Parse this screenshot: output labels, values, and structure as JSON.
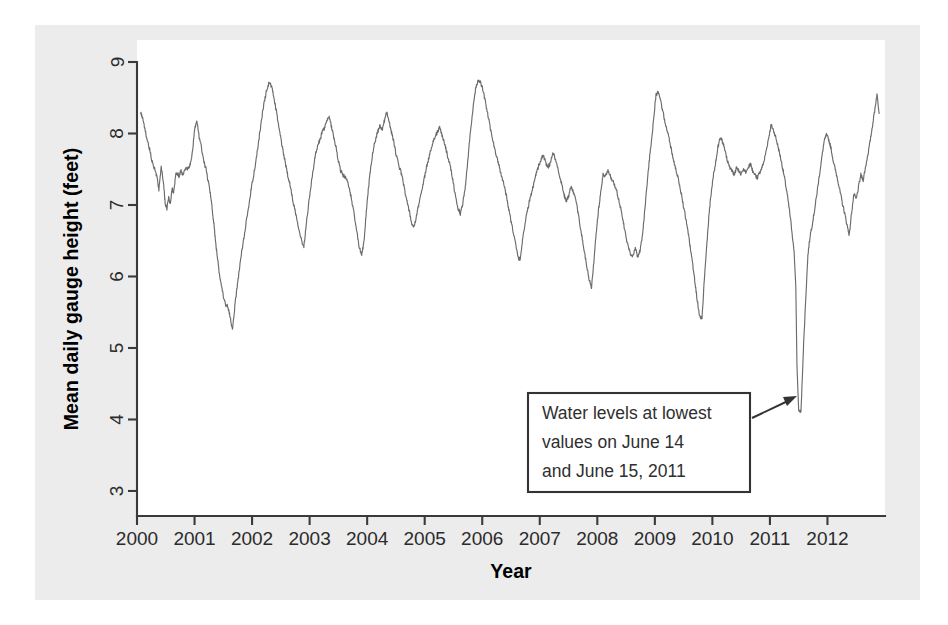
{
  "chart_data": {
    "type": "line",
    "title": "",
    "xlabel": "Year",
    "ylabel": "Mean daily gauge height (feet)",
    "xlim": [
      2000.0,
      2013.0
    ],
    "ylim": [
      2.65,
      9.0
    ],
    "xticks": [
      2000,
      2001,
      2002,
      2003,
      2004,
      2005,
      2006,
      2007,
      2008,
      2009,
      2010,
      2011,
      2012
    ],
    "xtick_labels": [
      "2000",
      "2001",
      "2002",
      "2003",
      "2004",
      "2005",
      "2006",
      "2007",
      "2008",
      "2009",
      "2010",
      "2011",
      "2012"
    ],
    "yticks": [
      3,
      4,
      5,
      6,
      7,
      8,
      9
    ],
    "ytick_labels": [
      "3",
      "4",
      "5",
      "6",
      "7",
      "8",
      "9"
    ],
    "grid": false,
    "legend": false,
    "line_color": "#6b6b6b",
    "series": [
      {
        "name": "Mean daily gauge height",
        "units": "feet",
        "x": [
          2000.06,
          2000.1,
          2000.14,
          2000.18,
          2000.22,
          2000.26,
          2000.3,
          2000.34,
          2000.38,
          2000.42,
          2000.46,
          2000.49,
          2000.52,
          2000.55,
          2000.58,
          2000.61,
          2000.64,
          2000.67,
          2000.7,
          2000.73,
          2000.76,
          2000.8,
          2000.84,
          2000.88,
          2000.92,
          2000.96,
          2001.0,
          2001.04,
          2001.08,
          2001.12,
          2001.16,
          2001.2,
          2001.24,
          2001.28,
          2001.31,
          2001.34,
          2001.37,
          2001.4,
          2001.43,
          2001.46,
          2001.5,
          2001.54,
          2001.58,
          2001.62,
          2001.66,
          2001.7,
          2001.74,
          2001.78,
          2001.82,
          2001.86,
          2001.9,
          2001.94,
          2001.98,
          2002.02,
          2002.06,
          2002.1,
          2002.14,
          2002.18,
          2002.22,
          2002.26,
          2002.3,
          2002.34,
          2002.38,
          2002.42,
          2002.46,
          2002.5,
          2002.54,
          2002.58,
          2002.62,
          2002.66,
          2002.7,
          2002.74,
          2002.78,
          2002.82,
          2002.86,
          2002.9,
          2002.94,
          2002.98,
          2003.02,
          2003.06,
          2003.1,
          2003.14,
          2003.18,
          2003.22,
          2003.26,
          2003.3,
          2003.34,
          2003.38,
          2003.42,
          2003.46,
          2003.5,
          2003.54,
          2003.58,
          2003.62,
          2003.66,
          2003.7,
          2003.74,
          2003.78,
          2003.82,
          2003.86,
          2003.9,
          2003.94,
          2003.98,
          2004.02,
          2004.06,
          2004.1,
          2004.14,
          2004.18,
          2004.22,
          2004.26,
          2004.3,
          2004.34,
          2004.38,
          2004.42,
          2004.46,
          2004.5,
          2004.54,
          2004.58,
          2004.62,
          2004.66,
          2004.7,
          2004.74,
          2004.78,
          2004.82,
          2004.86,
          2004.9,
          2004.94,
          2004.98,
          2005.02,
          2005.06,
          2005.1,
          2005.14,
          2005.18,
          2005.22,
          2005.26,
          2005.3,
          2005.34,
          2005.38,
          2005.42,
          2005.46,
          2005.5,
          2005.54,
          2005.58,
          2005.62,
          2005.66,
          2005.7,
          2005.74,
          2005.78,
          2005.82,
          2005.86,
          2005.9,
          2005.94,
          2005.98,
          2006.02,
          2006.06,
          2006.1,
          2006.14,
          2006.18,
          2006.22,
          2006.26,
          2006.3,
          2006.34,
          2006.38,
          2006.42,
          2006.46,
          2006.5,
          2006.54,
          2006.58,
          2006.62,
          2006.66,
          2006.7,
          2006.74,
          2006.78,
          2006.82,
          2006.86,
          2006.9,
          2006.94,
          2006.98,
          2007.02,
          2007.06,
          2007.1,
          2007.14,
          2007.18,
          2007.22,
          2007.26,
          2007.3,
          2007.34,
          2007.38,
          2007.42,
          2007.46,
          2007.5,
          2007.54,
          2007.58,
          2007.62,
          2007.66,
          2007.7,
          2007.74,
          2007.78,
          2007.82,
          2007.86,
          2007.9,
          2007.94,
          2007.98,
          2008.02,
          2008.06,
          2008.1,
          2008.14,
          2008.18,
          2008.22,
          2008.26,
          2008.3,
          2008.34,
          2008.38,
          2008.42,
          2008.46,
          2008.5,
          2008.54,
          2008.58,
          2008.62,
          2008.66,
          2008.7,
          2008.74,
          2008.78,
          2008.82,
          2008.86,
          2008.9,
          2008.94,
          2008.98,
          2009.02,
          2009.06,
          2009.1,
          2009.14,
          2009.18,
          2009.22,
          2009.26,
          2009.3,
          2009.34,
          2009.38,
          2009.42,
          2009.46,
          2009.5,
          2009.54,
          2009.58,
          2009.62,
          2009.66,
          2009.7,
          2009.74,
          2009.78,
          2009.82,
          2009.86,
          2009.9,
          2009.94,
          2009.98,
          2010.02,
          2010.06,
          2010.1,
          2010.14,
          2010.18,
          2010.22,
          2010.26,
          2010.3,
          2010.34,
          2010.38,
          2010.42,
          2010.46,
          2010.5,
          2010.54,
          2010.58,
          2010.62,
          2010.66,
          2010.7,
          2010.74,
          2010.78,
          2010.82,
          2010.86,
          2010.9,
          2010.94,
          2010.98,
          2011.02,
          2011.06,
          2011.1,
          2011.14,
          2011.18,
          2011.22,
          2011.26,
          2011.3,
          2011.34,
          2011.38,
          2011.42,
          2011.45,
          2011.46,
          2011.47,
          2011.5,
          2011.54,
          2011.58,
          2011.62,
          2011.66,
          2011.7,
          2011.74,
          2011.78,
          2011.82,
          2011.86,
          2011.9,
          2011.94,
          2011.98,
          2012.02,
          2012.06,
          2012.1,
          2012.14,
          2012.18,
          2012.22,
          2012.26,
          2012.3,
          2012.34,
          2012.38,
          2012.42,
          2012.46,
          2012.5,
          2012.54,
          2012.58,
          2012.62,
          2012.66,
          2012.7,
          2012.74,
          2012.78,
          2012.82,
          2012.86,
          2012.9
        ],
        "y": [
          8.3,
          8.22,
          8.05,
          7.9,
          7.78,
          7.62,
          7.52,
          7.42,
          7.2,
          7.55,
          7.3,
          7.02,
          6.95,
          7.1,
          7.02,
          7.22,
          7.18,
          7.42,
          7.44,
          7.4,
          7.48,
          7.42,
          7.52,
          7.5,
          7.56,
          7.72,
          8.05,
          8.18,
          7.95,
          7.8,
          7.62,
          7.5,
          7.32,
          7.14,
          6.92,
          6.7,
          6.45,
          6.25,
          6.05,
          5.9,
          5.72,
          5.6,
          5.58,
          5.42,
          5.25,
          5.58,
          5.85,
          6.1,
          6.35,
          6.55,
          6.78,
          6.95,
          7.2,
          7.38,
          7.58,
          7.8,
          8.05,
          8.28,
          8.48,
          8.62,
          8.72,
          8.65,
          8.5,
          8.32,
          8.12,
          7.92,
          7.75,
          7.58,
          7.42,
          7.28,
          7.1,
          6.95,
          6.8,
          6.65,
          6.5,
          6.42,
          6.72,
          7.0,
          7.25,
          7.48,
          7.7,
          7.82,
          7.92,
          8.02,
          8.08,
          8.18,
          8.22,
          8.1,
          7.95,
          7.8,
          7.62,
          7.48,
          7.42,
          7.38,
          7.32,
          7.2,
          7.02,
          6.85,
          6.62,
          6.42,
          6.3,
          6.45,
          6.85,
          7.22,
          7.52,
          7.75,
          7.9,
          8.02,
          8.1,
          8.05,
          8.18,
          8.3,
          8.18,
          8.02,
          7.9,
          7.72,
          7.58,
          7.48,
          7.35,
          7.18,
          7.02,
          6.88,
          6.72,
          6.7,
          6.85,
          7.02,
          7.18,
          7.32,
          7.48,
          7.62,
          7.75,
          7.88,
          7.95,
          8.02,
          8.08,
          7.98,
          7.88,
          7.75,
          7.62,
          7.48,
          7.3,
          7.1,
          6.95,
          6.88,
          7.02,
          7.2,
          7.55,
          7.9,
          8.22,
          8.5,
          8.68,
          8.75,
          8.7,
          8.58,
          8.42,
          8.25,
          8.08,
          7.92,
          7.78,
          7.65,
          7.52,
          7.4,
          7.28,
          7.12,
          6.95,
          6.78,
          6.62,
          6.45,
          6.28,
          6.22,
          6.52,
          6.72,
          6.9,
          7.05,
          7.18,
          7.32,
          7.45,
          7.55,
          7.62,
          7.7,
          7.6,
          7.52,
          7.58,
          7.72,
          7.68,
          7.55,
          7.42,
          7.3,
          7.15,
          7.05,
          7.12,
          7.25,
          7.18,
          7.08,
          6.92,
          6.72,
          6.52,
          6.32,
          6.12,
          5.95,
          5.85,
          6.2,
          6.6,
          6.92,
          7.18,
          7.42,
          7.4,
          7.48,
          7.42,
          7.35,
          7.28,
          7.18,
          7.05,
          6.9,
          6.72,
          6.55,
          6.4,
          6.32,
          6.28,
          6.4,
          6.28,
          6.35,
          6.55,
          6.88,
          7.25,
          7.6,
          7.9,
          8.2,
          8.55,
          8.58,
          8.45,
          8.3,
          8.15,
          8.02,
          7.88,
          7.72,
          7.58,
          7.45,
          7.32,
          7.15,
          6.98,
          6.8,
          6.6,
          6.38,
          6.15,
          5.9,
          5.65,
          5.45,
          5.42,
          5.95,
          6.4,
          6.85,
          7.18,
          7.42,
          7.62,
          7.82,
          7.95,
          7.88,
          7.75,
          7.62,
          7.52,
          7.48,
          7.42,
          7.52,
          7.48,
          7.42,
          7.5,
          7.45,
          7.52,
          7.58,
          7.48,
          7.42,
          7.38,
          7.45,
          7.52,
          7.62,
          7.78,
          7.95,
          8.12,
          8.05,
          7.95,
          7.82,
          7.68,
          7.52,
          7.35,
          7.15,
          6.92,
          6.65,
          6.35,
          5.85,
          5.3,
          4.75,
          4.12,
          4.1,
          4.95,
          5.65,
          6.3,
          6.58,
          6.75,
          6.95,
          7.18,
          7.42,
          7.65,
          7.88,
          7.98,
          7.92,
          7.8,
          7.62,
          7.48,
          7.35,
          7.18,
          7.02,
          6.88,
          6.72,
          6.58,
          6.9,
          7.15,
          7.08,
          7.25,
          7.42,
          7.35,
          7.52,
          7.7,
          7.88,
          8.1,
          8.32,
          8.55,
          8.28
        ]
      }
    ],
    "annotations": [
      {
        "name": "lowest-values-callout",
        "lines": [
          "Water levels at lowest",
          "values on June 14",
          "and June 15, 2011"
        ],
        "points_to": {
          "x": 2011.46,
          "y": 4.1
        }
      }
    ]
  },
  "axes": {
    "x_title": "Year",
    "y_title": "Mean daily gauge height (feet)"
  }
}
